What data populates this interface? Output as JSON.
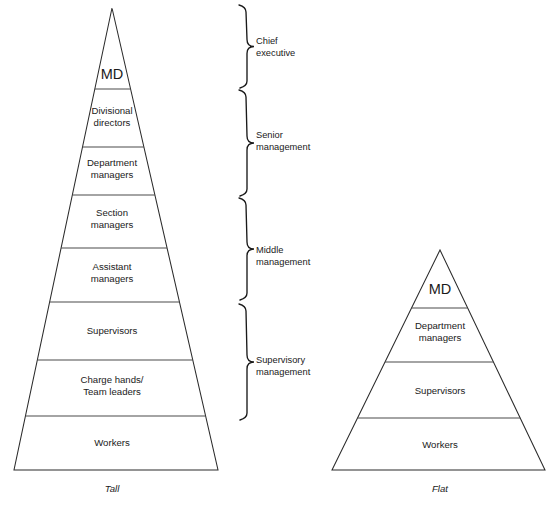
{
  "diagram": {
    "type": "organisational-structure-comparison",
    "structures": [
      {
        "id": "tall",
        "caption": "Tall",
        "caption_x": 112,
        "caption_y": 492,
        "apex": {
          "x": 112,
          "y": 8
        },
        "base": {
          "left_x": 14,
          "right_x": 218,
          "y": 470
        },
        "tiers": [
          {
            "name": "MD",
            "lines": [
              "MD"
            ],
            "top_y": 8,
            "bottom_y": 89,
            "label_cx": 112,
            "label_cy": 79,
            "emphasis": "md"
          },
          {
            "name": "Divisional directors",
            "lines": [
              "Divisional",
              "directors"
            ],
            "top_y": 89,
            "bottom_y": 147,
            "label_cx": 112,
            "label_cy": 114,
            "emphasis": "normal"
          },
          {
            "name": "Department managers",
            "lines": [
              "Department",
              "managers"
            ],
            "top_y": 147,
            "bottom_y": 195,
            "label_cx": 112,
            "label_cy": 166,
            "emphasis": "normal"
          },
          {
            "name": "Section managers",
            "lines": [
              "Section",
              "managers"
            ],
            "top_y": 195,
            "bottom_y": 248,
            "label_cx": 112,
            "label_cy": 216,
            "emphasis": "normal"
          },
          {
            "name": "Assistant managers",
            "lines": [
              "Assistant",
              "managers"
            ],
            "top_y": 248,
            "bottom_y": 302,
            "label_cx": 112,
            "label_cy": 270,
            "emphasis": "normal"
          },
          {
            "name": "Supervisors",
            "lines": [
              "Supervisors"
            ],
            "top_y": 302,
            "bottom_y": 360,
            "label_cx": 112,
            "label_cy": 334,
            "emphasis": "normal"
          },
          {
            "name": "Charge hands / Team leaders",
            "lines": [
              "Charge hands/",
              "Team leaders"
            ],
            "top_y": 360,
            "bottom_y": 416,
            "label_cx": 112,
            "label_cy": 383,
            "emphasis": "normal"
          },
          {
            "name": "Workers",
            "lines": [
              "Workers"
            ],
            "top_y": 416,
            "bottom_y": 470,
            "label_cx": 112,
            "label_cy": 446,
            "emphasis": "normal"
          }
        ]
      },
      {
        "id": "flat",
        "caption": "Flat",
        "caption_x": 440,
        "caption_y": 492,
        "apex": {
          "x": 440,
          "y": 250
        },
        "base": {
          "left_x": 332,
          "right_x": 545,
          "y": 470
        },
        "tiers": [
          {
            "name": "MD",
            "lines": [
              "MD"
            ],
            "top_y": 250,
            "bottom_y": 308,
            "label_cx": 440,
            "label_cy": 294,
            "emphasis": "md"
          },
          {
            "name": "Department managers",
            "lines": [
              "Department",
              "managers"
            ],
            "top_y": 308,
            "bottom_y": 362,
            "label_cx": 440,
            "label_cy": 329,
            "emphasis": "normal"
          },
          {
            "name": "Supervisors",
            "lines": [
              "Supervisors"
            ],
            "top_y": 362,
            "bottom_y": 418,
            "label_cx": 440,
            "label_cy": 394,
            "emphasis": "normal"
          },
          {
            "name": "Workers",
            "lines": [
              "Workers"
            ],
            "top_y": 418,
            "bottom_y": 470,
            "label_cx": 440,
            "label_cy": 448,
            "emphasis": "normal"
          }
        ]
      }
    ],
    "management_levels": [
      {
        "id": "chief-executive",
        "lines": [
          "Chief",
          "executive"
        ],
        "brace_top_y": 5,
        "brace_bottom_y": 88,
        "brace_x": 240,
        "label_x": 256,
        "label_cy": 44
      },
      {
        "id": "senior-management",
        "lines": [
          "Senior",
          "management"
        ],
        "brace_top_y": 90,
        "brace_bottom_y": 196,
        "brace_x": 240,
        "label_x": 256,
        "label_cy": 138
      },
      {
        "id": "middle-management",
        "lines": [
          "Middle",
          "management"
        ],
        "brace_top_y": 198,
        "brace_bottom_y": 300,
        "brace_x": 240,
        "label_x": 256,
        "label_cy": 253
      },
      {
        "id": "supervisory-management",
        "lines": [
          "Supervisory",
          "management"
        ],
        "brace_top_y": 304,
        "brace_bottom_y": 420,
        "brace_x": 240,
        "label_x": 256,
        "label_cy": 363
      }
    ],
    "colors": {
      "outline": "#2b2b2b",
      "divider": "#4a4a4a",
      "text": "#1a1a1a",
      "background": "#ffffff"
    }
  }
}
